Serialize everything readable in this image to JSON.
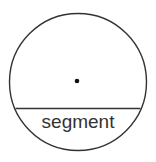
{
  "diagram": {
    "label": "segment",
    "colors": {
      "stroke": "#333333",
      "background": "#ffffff",
      "dot": "#111111"
    },
    "circle": {
      "cx": 78,
      "cy": 82,
      "r": 68.5
    },
    "chord_y": 108.5,
    "center_dot": {
      "cx": 77,
      "cy": 81,
      "r": 2.3
    }
  }
}
